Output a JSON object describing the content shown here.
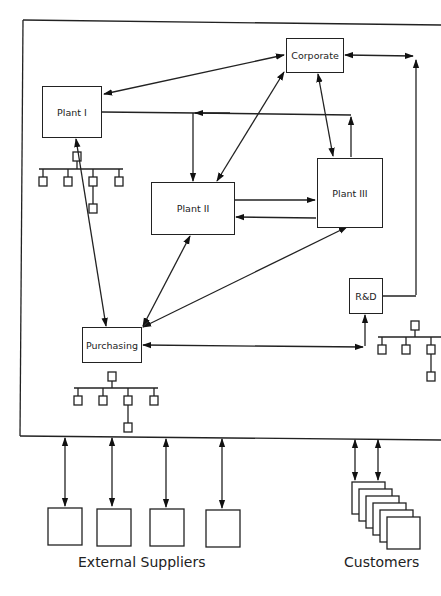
{
  "diagram": {
    "type": "organizational-network",
    "nodes": {
      "corporate": {
        "label": "Corporate"
      },
      "plant1": {
        "label": "Plant I"
      },
      "plant2": {
        "label": "Plant II"
      },
      "plant3": {
        "label": "Plant III"
      },
      "rnd": {
        "label": "R&D"
      },
      "purchasing": {
        "label": "Purchasing"
      }
    },
    "captions": {
      "suppliers": "External Suppliers",
      "customers": "Customers"
    },
    "edges": [
      {
        "from": "corporate",
        "to": "plant1",
        "direction": "both"
      },
      {
        "from": "corporate",
        "to": "plant2",
        "direction": "both"
      },
      {
        "from": "corporate",
        "to": "plant3",
        "direction": "both"
      },
      {
        "from": "corporate",
        "to": "rnd",
        "direction": "both"
      },
      {
        "from": "plant3",
        "to": "plant1",
        "direction": "forward"
      },
      {
        "from": "plant3",
        "to": "plant2",
        "direction": "forward"
      },
      {
        "from": "plant2",
        "to": "plant3",
        "direction": "forward"
      },
      {
        "from": "plant1",
        "to": "purchasing",
        "direction": "both"
      },
      {
        "from": "plant2",
        "to": "purchasing",
        "direction": "both"
      },
      {
        "from": "plant3",
        "to": "purchasing",
        "direction": "both"
      },
      {
        "from": "purchasing",
        "to": "rnd",
        "direction": "both"
      },
      {
        "from": "enterprise",
        "to": "external-suppliers",
        "direction": "both",
        "count": 4
      },
      {
        "from": "enterprise",
        "to": "customers",
        "direction": "both",
        "count": 2
      }
    ],
    "supplier_count": 4,
    "customer_stack_count": 6
  }
}
